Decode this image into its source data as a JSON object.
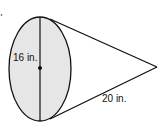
{
  "diagram": {
    "shape": "cone",
    "labels": {
      "diameter": "16 in.",
      "slant_height": "20 in."
    },
    "colors": {
      "stroke": "#111111",
      "base_fill": "#e6e6e6",
      "background": "#ffffff"
    }
  }
}
